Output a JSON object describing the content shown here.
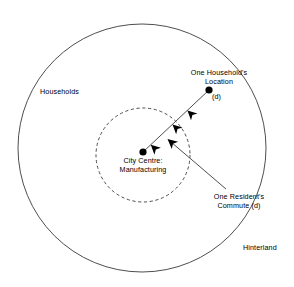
{
  "diagram": {
    "background_color": "#ffffff",
    "stroke_color": "#3a3a3a",
    "marker_color": "#000000",
    "text_color": "#000000",
    "outer_circle": {
      "name": "hinterland-boundary",
      "cx": 142,
      "cy": 148,
      "r": 124,
      "style": "solid"
    },
    "inner_circle": {
      "name": "city-centre-boundary",
      "cx": 143,
      "cy": 155,
      "r": 47,
      "style": "dashed"
    },
    "points": {
      "household": {
        "x": 209,
        "y": 90,
        "r": 3.6
      },
      "city_centre": {
        "x": 143,
        "y": 152,
        "r": 3.6
      }
    },
    "commute_line": {
      "x1": 209,
      "y1": 90,
      "x2": 143,
      "y2": 152,
      "arrow_count": 3
    },
    "leader_line": {
      "x1": 226,
      "y1": 189,
      "x2": 168,
      "y2": 139
    },
    "labels": {
      "households": "Households",
      "hinterland": "Hinterland",
      "household_location_line1": "One Household's",
      "household_location_line2": "Location",
      "household_distance": "(d)",
      "city_centre_line1": "City Centre:",
      "city_centre_line2": "Manufacturing",
      "commute_line1": "One Resident's",
      "commute_line2": "Commute (d)"
    }
  }
}
